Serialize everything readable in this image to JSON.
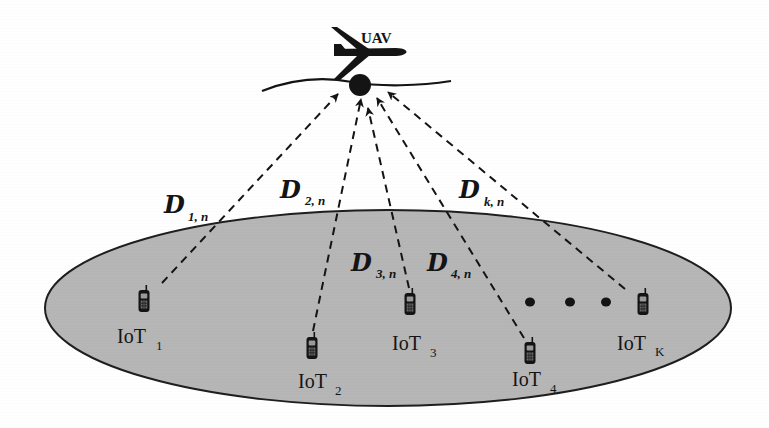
{
  "diagram": {
    "type": "uav-iot-network",
    "colors": {
      "background": "#ffffff",
      "ground_fill": "#b6b6b6",
      "ground_stroke": "#1e1e1e",
      "ink": "#141414"
    },
    "uav": {
      "label": "UAV",
      "position": [
        360,
        84
      ]
    },
    "ground_area": {
      "center": [
        388,
        308
      ],
      "rx": 343,
      "ry": 98
    },
    "devices": [
      {
        "id": "iot1",
        "label": "IoT",
        "subscript": "1",
        "position": [
          144,
          308
        ]
      },
      {
        "id": "iot2",
        "label": "IoT",
        "subscript": "2",
        "position": [
          313,
          353
        ]
      },
      {
        "id": "iot3",
        "label": "IoT",
        "subscript": "3",
        "position": [
          409,
          312
        ]
      },
      {
        "id": "iot4",
        "label": "IoT",
        "subscript": "4",
        "position": [
          530,
          352
        ]
      },
      {
        "id": "iotK",
        "label": "IoT",
        "subscript": "K",
        "position": [
          639,
          308
        ]
      }
    ],
    "ellipsis": "• • •",
    "links": [
      {
        "id": "link1",
        "label": "D",
        "subscript": "1, n",
        "from": "iot1"
      },
      {
        "id": "link2",
        "label": "D",
        "subscript": "2, n",
        "from": "iot2"
      },
      {
        "id": "link3",
        "label": "D",
        "subscript": "3, n",
        "from": "iot3"
      },
      {
        "id": "link4",
        "label": "D",
        "subscript": "4, n",
        "from": "iot4"
      },
      {
        "id": "linkK",
        "label": "D",
        "subscript": "k, n",
        "from": "iotK"
      }
    ]
  }
}
